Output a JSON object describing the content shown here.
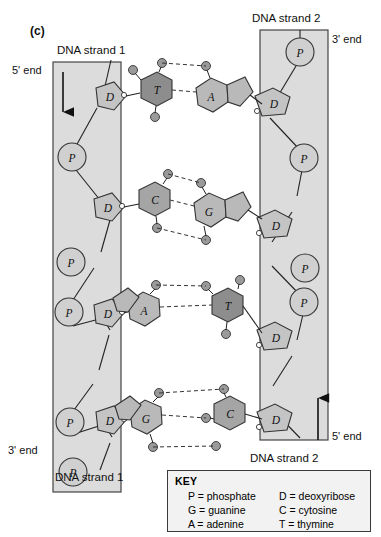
{
  "figure": {
    "panel_label": "(c)",
    "type": "dna-double-helix-structure"
  },
  "labels": {
    "strand1_top": "DNA strand 1",
    "strand1_bottom": "DNA strand 1",
    "strand2_top": "DNA strand 2",
    "strand2_bottom": "DNA strand 2",
    "five_end_left": "5' end",
    "three_end_left": "3' end",
    "three_end_right": "3' end",
    "five_end_right": "5' end"
  },
  "strands": {
    "left": {
      "name": "DNA strand 1",
      "direction": "down",
      "top_end": "5' end",
      "bottom_end": "3' end",
      "backbone": [
        "D",
        "P",
        "D",
        "P",
        "D",
        "P",
        "D",
        "P"
      ]
    },
    "right": {
      "name": "DNA strand 2",
      "direction": "up",
      "top_end": "3' end",
      "bottom_end": "5' end",
      "backbone": [
        "P",
        "D",
        "P",
        "D",
        "P",
        "D",
        "P",
        "D"
      ]
    }
  },
  "base_pairs": [
    {
      "left_base": "T",
      "right_base": "A",
      "hydrogen_bonds": 2,
      "left_type": "pyrimidine",
      "right_type": "purine"
    },
    {
      "left_base": "C",
      "right_base": "G",
      "hydrogen_bonds": 3,
      "left_type": "pyrimidine",
      "right_type": "purine"
    },
    {
      "left_base": "A",
      "right_base": "T",
      "hydrogen_bonds": 2,
      "left_type": "purine",
      "right_type": "pyrimidine"
    },
    {
      "left_base": "G",
      "right_base": "C",
      "hydrogen_bonds": 3,
      "left_type": "purine",
      "right_type": "pyrimidine"
    }
  ],
  "key": {
    "title": "KEY",
    "entries": [
      {
        "symbol": "P",
        "meaning": "P = phosphate"
      },
      {
        "symbol": "D",
        "meaning": "D = deoxyribose"
      },
      {
        "symbol": "G",
        "meaning": "G = guanine"
      },
      {
        "symbol": "C",
        "meaning": "C = cytosine"
      },
      {
        "symbol": "A",
        "meaning": "A = adenine"
      },
      {
        "symbol": "T",
        "meaning": "T = thymine"
      }
    ],
    "rows": [
      {
        "left": "P = phosphate",
        "right": "D = deoxyribose"
      },
      {
        "left": "G = guanine",
        "right": "C = cytosine"
      },
      {
        "left": "A = adenine",
        "right": "T = thymine"
      }
    ]
  },
  "colors": {
    "panel_fill": "#dcdcdc",
    "panel_stroke": "#444444",
    "phosphate_fill": "#d0d0d0",
    "deoxyribose_fill": "#c4c4c4",
    "pyrimidine_dark_fill": "#8d8d8d",
    "purine_light_fill": "#b9b9b9",
    "atom_fill": "#9a9a9a",
    "bond_stroke": "#222222",
    "key_background": "#f2f2f2"
  }
}
